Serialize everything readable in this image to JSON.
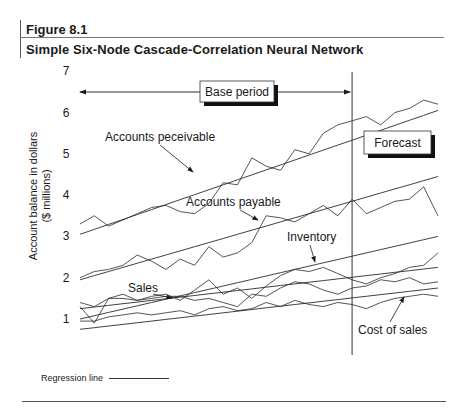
{
  "figure": {
    "number": "Figure 8.1",
    "title": "Simple Six-Node Cascade-Correlation Neural Network"
  },
  "legend": {
    "label": "Regression line"
  },
  "chart_data": {
    "type": "line",
    "title": "Simple Six-Node Cascade-Correlation Neural Network",
    "xlabel": "",
    "ylabel": "Account balance in dollars ($ millions)",
    "ylim": [
      0.7,
      7
    ],
    "yticks": [
      1,
      2,
      3,
      4,
      5,
      6,
      7
    ],
    "grid": false,
    "legend_position": "bottom-left",
    "annotations": [
      {
        "text": "Base period",
        "type": "boxed-label",
        "spans": "start to forecast divider"
      },
      {
        "text": "Forecast",
        "type": "boxed-label"
      },
      {
        "text": "Accounts peceivable",
        "type": "arrow-label"
      },
      {
        "text": "Accounts payable",
        "type": "arrow-label"
      },
      {
        "text": "Inventory",
        "type": "arrow-label"
      },
      {
        "text": "Sales",
        "type": "arrow-label"
      },
      {
        "text": "Cost of sales",
        "type": "arrow-label"
      }
    ],
    "forecast_divider_x": 0.76,
    "x": [
      0,
      0.04,
      0.08,
      0.12,
      0.16,
      0.2,
      0.24,
      0.28,
      0.32,
      0.36,
      0.4,
      0.44,
      0.48,
      0.52,
      0.56,
      0.6,
      0.64,
      0.68,
      0.72,
      0.76,
      0.8,
      0.84,
      0.88,
      0.92,
      0.96,
      1.0
    ],
    "series": [
      {
        "name": "Accounts receivable",
        "values": [
          3.3,
          3.5,
          3.25,
          3.4,
          3.55,
          3.7,
          3.75,
          3.6,
          3.55,
          3.8,
          4.3,
          4.25,
          4.9,
          4.7,
          4.6,
          5.1,
          5.0,
          5.5,
          5.7,
          5.8,
          5.9,
          5.7,
          6.0,
          6.1,
          6.3,
          6.2
        ]
      },
      {
        "name": "Accounts receivable regression",
        "regression": true,
        "values": [
          3.05,
          3.17,
          3.29,
          3.41,
          3.53,
          3.65,
          3.77,
          3.89,
          4.01,
          4.13,
          4.25,
          4.37,
          4.49,
          4.61,
          4.73,
          4.85,
          4.97,
          5.09,
          5.21,
          5.33,
          5.45,
          5.57,
          5.69,
          5.81,
          5.93,
          6.05
        ]
      },
      {
        "name": "Accounts payable",
        "values": [
          2.0,
          2.15,
          2.2,
          2.3,
          2.55,
          2.4,
          2.2,
          2.45,
          2.3,
          2.75,
          2.5,
          2.6,
          2.85,
          3.5,
          3.45,
          3.35,
          3.55,
          3.75,
          3.5,
          3.9,
          3.55,
          3.7,
          3.85,
          3.9,
          4.2,
          3.5
        ]
      },
      {
        "name": "Accounts payable regression",
        "regression": true,
        "values": [
          1.95,
          2.05,
          2.15,
          2.25,
          2.35,
          2.45,
          2.55,
          2.65,
          2.75,
          2.85,
          2.95,
          3.05,
          3.15,
          3.25,
          3.35,
          3.45,
          3.55,
          3.65,
          3.75,
          3.85,
          3.95,
          4.05,
          4.15,
          4.25,
          4.35,
          4.45
        ]
      },
      {
        "name": "Inventory",
        "values": [
          1.4,
          1.3,
          1.5,
          1.6,
          1.45,
          1.55,
          1.6,
          1.45,
          1.7,
          1.95,
          1.6,
          1.75,
          1.5,
          1.8,
          2.05,
          2.2,
          2.15,
          2.25,
          2.1,
          1.95,
          1.85,
          2.0,
          2.1,
          2.25,
          2.3,
          2.6
        ]
      },
      {
        "name": "Inventory regression",
        "regression": true,
        "values": [
          1.0,
          1.08,
          1.16,
          1.24,
          1.32,
          1.4,
          1.48,
          1.56,
          1.64,
          1.72,
          1.8,
          1.88,
          1.96,
          2.04,
          2.12,
          2.2,
          2.28,
          2.36,
          2.44,
          2.52,
          2.6,
          2.68,
          2.76,
          2.84,
          2.92,
          3.0
        ]
      },
      {
        "name": "Sales",
        "values": [
          1.3,
          0.9,
          1.5,
          1.5,
          1.45,
          1.5,
          1.55,
          1.55,
          1.45,
          1.5,
          1.4,
          1.3,
          1.6,
          1.55,
          1.75,
          1.9,
          1.85,
          1.7,
          1.6,
          1.75,
          1.8,
          1.95,
          1.9,
          2.0,
          1.85,
          1.9
        ]
      },
      {
        "name": "Sales regression",
        "regression": true,
        "values": [
          1.25,
          1.29,
          1.33,
          1.37,
          1.41,
          1.45,
          1.49,
          1.53,
          1.57,
          1.61,
          1.65,
          1.69,
          1.73,
          1.77,
          1.81,
          1.85,
          1.89,
          1.93,
          1.97,
          2.01,
          2.05,
          2.09,
          2.13,
          2.17,
          2.21,
          2.25
        ]
      },
      {
        "name": "Cost of sales",
        "values": [
          0.95,
          0.95,
          1.05,
          1.1,
          1.15,
          1.1,
          1.15,
          1.2,
          1.1,
          1.25,
          1.3,
          1.2,
          1.25,
          1.4,
          1.3,
          1.45,
          1.35,
          1.3,
          1.4,
          1.35,
          1.25,
          1.4,
          1.5,
          1.55,
          1.6,
          1.55
        ]
      },
      {
        "name": "Cost of sales regression",
        "regression": true,
        "values": [
          0.75,
          0.79,
          0.83,
          0.87,
          0.91,
          0.95,
          0.99,
          1.03,
          1.07,
          1.11,
          1.15,
          1.19,
          1.23,
          1.27,
          1.31,
          1.35,
          1.39,
          1.43,
          1.47,
          1.51,
          1.55,
          1.59,
          1.63,
          1.67,
          1.71,
          1.75
        ]
      }
    ]
  }
}
